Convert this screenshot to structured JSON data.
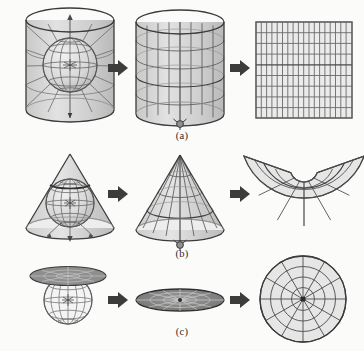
{
  "figure": {
    "background_color": "#fbfbfa",
    "ink_color": "#3a3a3a",
    "line_color": "#4a4a4a",
    "fill_color": "#d6d6d6",
    "arrow_color": "#3c3c3c",
    "width": 364,
    "height": 351
  },
  "captions": {
    "a": "(a)",
    "b": "(b)",
    "c": "(c)"
  },
  "rows": [
    {
      "id": "row-a",
      "label": "(a)",
      "projection_family": "cylindrical",
      "stages": [
        {
          "name": "globe-in-cylinder",
          "description": "Globe with graticule enclosed by a tangent cylinder, projection rays radiating outward",
          "surface": "cylinder"
        },
        {
          "name": "cylinder-with-graticule",
          "description": "Cylinder carrying the projected graticule of meridians and parallels",
          "surface": "cylinder"
        },
        {
          "name": "unrolled-rectangle",
          "description": "Cylinder cut and unrolled into a rectangular map grid",
          "surface": "plane",
          "grid": {
            "meridians": 18,
            "parallels": 9
          }
        }
      ]
    },
    {
      "id": "row-b",
      "label": "(b)",
      "projection_family": "conic",
      "stages": [
        {
          "name": "globe-in-cone",
          "description": "Globe with graticule enclosed by a tangent cone, projection rays radiating outward",
          "surface": "cone"
        },
        {
          "name": "cone-with-graticule",
          "description": "Cone carrying the projected graticule of meridians and parallels",
          "surface": "cone"
        },
        {
          "name": "unrolled-fan",
          "description": "Cone cut and unrolled into a fan-shaped map with radial meridians and arc parallels",
          "surface": "plane",
          "grid": {
            "meridians": 8,
            "parallels": 4
          }
        }
      ]
    },
    {
      "id": "row-c",
      "label": "(c)",
      "projection_family": "azimuthal",
      "stages": [
        {
          "name": "globe-with-tangent-plane",
          "description": "Globe with graticule touched at the pole by a tangent plane",
          "surface": "plane"
        },
        {
          "name": "tilted-disc",
          "description": "Tangent plane seen edge-on as a flattened disc carrying the projected graticule",
          "surface": "plane"
        },
        {
          "name": "polar-disc",
          "description": "Plane viewed face-on as a circular polar map with radial meridians and concentric parallels",
          "surface": "plane",
          "grid": {
            "meridians": 12,
            "parallels": 4
          }
        }
      ]
    }
  ],
  "arrows": [
    {
      "name": "arrow-a-1",
      "direction": "right"
    },
    {
      "name": "arrow-a-2",
      "direction": "right"
    },
    {
      "name": "arrow-b-1",
      "direction": "right"
    },
    {
      "name": "arrow-b-2",
      "direction": "right"
    },
    {
      "name": "arrow-c-1",
      "direction": "right"
    },
    {
      "name": "arrow-c-2",
      "direction": "right"
    }
  ]
}
